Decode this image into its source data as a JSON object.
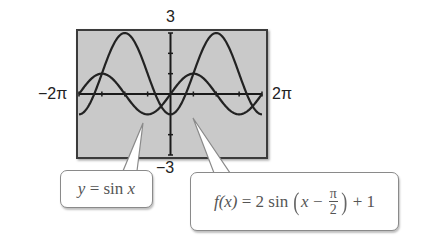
{
  "chart_data": {
    "type": "line",
    "title": "",
    "xlabel": "",
    "ylabel": "",
    "xlim": [
      -6.2832,
      6.2832
    ],
    "ylim": [
      -3,
      3
    ],
    "x_tick_labels": {
      "left": "−2π",
      "right": "2π"
    },
    "y_tick_labels": {
      "top": "3",
      "bottom": "−3"
    },
    "x_tick_step": 1.5708,
    "y_tick_step": 1,
    "grid": false,
    "background": "#c9c9c9",
    "series": [
      {
        "name": "y = sin x",
        "formula": "sin(x)",
        "amplitude": 1,
        "phase_shift": 0,
        "vertical_shift": 0,
        "color": "#222222"
      },
      {
        "name": "f(x) = 2 sin(x − π/2) + 1",
        "formula": "2*sin(x - pi/2) + 1",
        "amplitude": 2,
        "phase_shift": 1.5708,
        "vertical_shift": 1,
        "color": "#222222"
      }
    ]
  },
  "labels": {
    "y_max": "3",
    "y_min": "−3",
    "x_min": "−2π",
    "x_max": "2π"
  },
  "callouts": {
    "sin": {
      "lhs": "y",
      "eq": " = sin ",
      "var": "x"
    },
    "f": {
      "fname": "f",
      "arg": "(x)",
      "eq": " = 2 sin ",
      "inner_x": "x",
      "minus": " − ",
      "num": "π",
      "den": "2",
      "plus": " + 1"
    }
  }
}
